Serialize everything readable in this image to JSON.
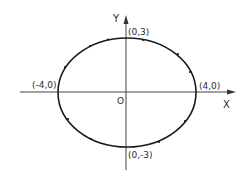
{
  "diagram": {
    "type": "ellipse",
    "equation_params": {
      "a": 4,
      "b": 3,
      "center": [
        0,
        0
      ]
    },
    "axes": {
      "x_label": "X",
      "y_label": "Y",
      "origin_label": "O"
    },
    "points": [
      {
        "name": "top-vertex",
        "label": "(0,3)"
      },
      {
        "name": "bottom-vertex",
        "label": "(0,-3)"
      },
      {
        "name": "left-vertex",
        "label": "(-4,0)"
      },
      {
        "name": "right-vertex",
        "label": "(4,0)"
      }
    ],
    "colors": {
      "stroke": "#1a1a1a",
      "background": "#ffffff"
    }
  }
}
